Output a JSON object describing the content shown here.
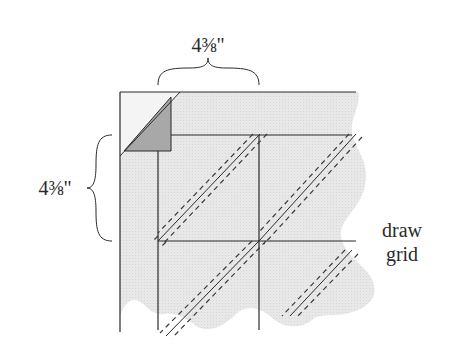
{
  "diagram": {
    "top_dimension": "4⅜\"",
    "left_dimension": "4⅜\"",
    "instruction_line1": "draw",
    "instruction_line2": "grid",
    "colors": {
      "fabric": "#e6e6e6",
      "corner_fabric": "#f4f4f4",
      "folded_triangle": "#a9a9a9",
      "line": "#2b2b2b",
      "dashed_line": "#3a3a3a"
    },
    "grid": {
      "columns": 2,
      "rows": 2,
      "square_size_label": "4⅜\""
    }
  }
}
